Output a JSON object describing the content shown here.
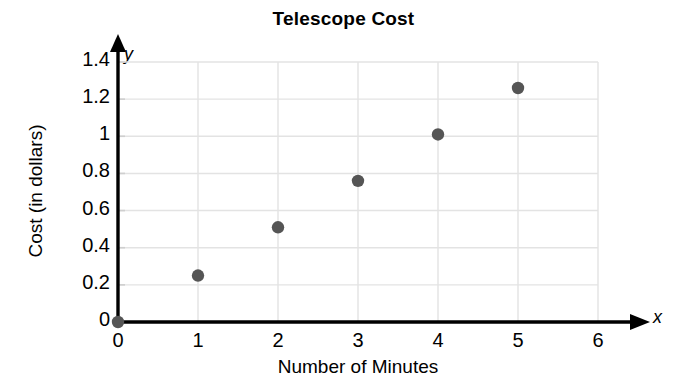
{
  "chart_data": {
    "type": "scatter",
    "title": "Telescope Cost",
    "xlabel": "Number of Minutes",
    "ylabel": "Cost (in dollars)",
    "x_axis_symbol": "x",
    "y_axis_symbol": "y",
    "xlim": [
      0,
      6
    ],
    "ylim": [
      0,
      1.4
    ],
    "x_ticks": [
      0,
      1,
      2,
      3,
      4,
      5,
      6
    ],
    "x_tick_labels": [
      "0",
      "1",
      "2",
      "3",
      "4",
      "5",
      "6"
    ],
    "y_ticks": [
      0,
      0.2,
      0.4,
      0.6,
      0.8,
      1,
      1.2,
      1.4
    ],
    "y_tick_labels": [
      "0",
      "0.2",
      "0.4",
      "0.6",
      "0.8",
      "1",
      "1.2",
      "1.4"
    ],
    "grid": true,
    "legend": false,
    "marker_color": "#555555",
    "grid_color": "#e3e3e3",
    "axis_color": "#000000",
    "points": [
      {
        "x": 0,
        "y": 0
      },
      {
        "x": 1,
        "y": 0.25
      },
      {
        "x": 2,
        "y": 0.51
      },
      {
        "x": 3,
        "y": 0.76
      },
      {
        "x": 4,
        "y": 1.01
      },
      {
        "x": 5,
        "y": 1.26
      }
    ],
    "x": [
      0,
      1,
      2,
      3,
      4,
      5
    ],
    "values": [
      0,
      0.25,
      0.51,
      0.76,
      1.01,
      1.26
    ]
  }
}
